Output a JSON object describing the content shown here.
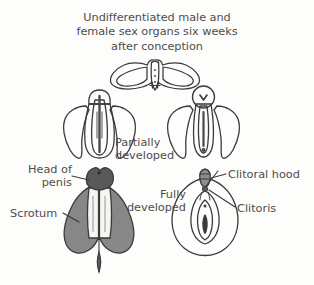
{
  "title": {
    "lines": [
      "Undifferentiated male and",
      "female sex organs six weeks",
      "after conception"
    ],
    "full": "Undifferentiated male and female sex organs six weeks after conception"
  },
  "labels": {
    "partially_developed": {
      "line1": "Partially",
      "line2": "developed"
    },
    "fully_developed": {
      "line1": "Fully",
      "line2": "developed"
    },
    "head_of_penis": {
      "line1": "Head of",
      "line2": "penis"
    },
    "scrotum": "Scrotum",
    "clitoral_hood": "Clitoral hood",
    "clitoris": "Clitoris"
  },
  "figures": [
    {
      "name": "undifferentiated-genital-tubercle",
      "stage": "undifferentiated",
      "sex": "none",
      "position": "top-center"
    },
    {
      "name": "partially-developed-male",
      "stage": "partially developed",
      "sex": "male",
      "position": "middle-left"
    },
    {
      "name": "partially-developed-female",
      "stage": "partially developed",
      "sex": "female",
      "position": "middle-right"
    },
    {
      "name": "fully-developed-male",
      "stage": "fully developed",
      "sex": "male",
      "position": "bottom-left"
    },
    {
      "name": "fully-developed-female",
      "stage": "fully developed",
      "sex": "female",
      "position": "bottom-right"
    }
  ],
  "colors": {
    "background": "#fdfdfb",
    "text": "#4d4d4d",
    "ink": "#3a3a3a",
    "shade_mid": "#878787",
    "shade_dark": "#595959",
    "shade_light": "#bdbdbd",
    "highlight": "#f5f5f2"
  }
}
